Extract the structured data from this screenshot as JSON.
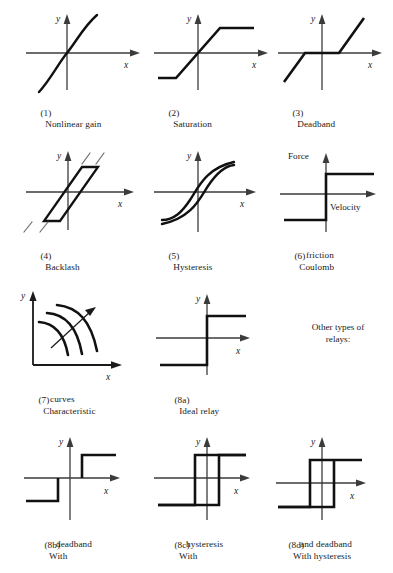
{
  "page": {
    "background": "#ffffff",
    "ink": "#1a1a1a",
    "axis_color": "#3b3b3b",
    "curve_color": "#111111",
    "width": 393,
    "height": 573
  },
  "notes": {
    "other_relays_line1": "Other types of",
    "other_relays_line2": "relays:"
  },
  "axes": {
    "x": "x",
    "y": "y",
    "force": "Force",
    "velocity": "Velocity"
  },
  "figures": [
    {
      "id": "nonlinear-gain",
      "number": "(1)",
      "caption_line1": "Nonlinear gain",
      "caption_line2": "",
      "xlabel": "x",
      "ylabel": "y",
      "type": "curve"
    },
    {
      "id": "saturation",
      "number": "(2)",
      "caption_line1": "Saturation",
      "caption_line2": "",
      "xlabel": "x",
      "ylabel": "y",
      "type": "piecewise"
    },
    {
      "id": "deadband",
      "number": "(3)",
      "caption_line1": "Deadband",
      "caption_line2": "",
      "xlabel": "x",
      "ylabel": "y",
      "type": "piecewise"
    },
    {
      "id": "backlash",
      "number": "(4)",
      "caption_line1": "Backlash",
      "caption_line2": "",
      "xlabel": "x",
      "ylabel": "y",
      "type": "parallelogram-loop"
    },
    {
      "id": "hysteresis",
      "number": "(5)",
      "caption_line1": "Hysteresis",
      "caption_line2": "",
      "xlabel": "x",
      "ylabel": "y",
      "type": "loop"
    },
    {
      "id": "coulomb-friction",
      "number": "(6)",
      "caption_line1": "Coulomb",
      "caption_line2": "friction",
      "xlabel": "Velocity",
      "ylabel": "Force",
      "type": "step"
    },
    {
      "id": "characteristic-curves",
      "number": "(7)",
      "caption_line1": "Characteristic",
      "caption_line2": "curves",
      "xlabel": "x",
      "ylabel": "y",
      "type": "family-of-curves"
    },
    {
      "id": "ideal-relay",
      "number": "(8a)",
      "caption_line1": "Ideal relay",
      "caption_line2": "",
      "xlabel": "x",
      "ylabel": "y",
      "type": "step"
    },
    {
      "id": "relay-with-deadband",
      "number": "(8b)",
      "caption_line1": "With",
      "caption_line2": "deadband",
      "xlabel": "x",
      "ylabel": "y",
      "type": "step-deadband"
    },
    {
      "id": "relay-with-hysteresis",
      "number": "(8c)",
      "caption_line1": "With",
      "caption_line2": "hysteresis",
      "xlabel": "x",
      "ylabel": "y",
      "type": "step-hysteresis"
    },
    {
      "id": "relay-with-hysteresis-and-deadband",
      "number": "(8d)",
      "caption_line1": "With hysteresis",
      "caption_line2": "and deadband",
      "xlabel": "x",
      "ylabel": "y",
      "type": "step-hysteresis-deadband"
    }
  ]
}
